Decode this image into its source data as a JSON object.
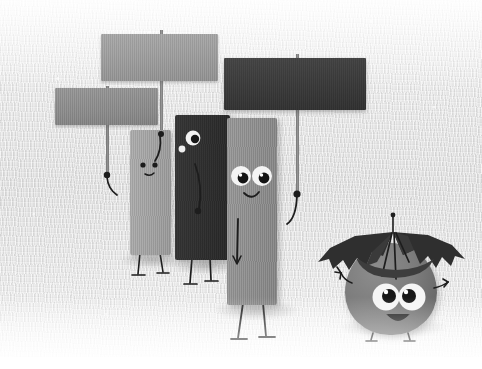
{
  "artwork": {
    "title": "Protesting Rectangles in the Rain",
    "medium": "textured canvas illustration",
    "palette": "grayscale",
    "background_color": "#e8e8e8",
    "canvas_width": 482,
    "canvas_height": 369,
    "illustration_height": 357,
    "bottom_margin_color": "#ffffff"
  },
  "signs": [
    {
      "name": "top-left-protest-sign",
      "label": "",
      "state": "blank",
      "color": "#9c9c9c",
      "x": 101,
      "y": 34,
      "w": 117,
      "h": 47,
      "pole_color": "#8a8a8a"
    },
    {
      "name": "lower-left-protest-sign",
      "label": "",
      "state": "blank",
      "color": "#8a8a8a",
      "x": 55,
      "y": 88,
      "w": 103,
      "h": 37,
      "pole_color": "#7e7e7e"
    },
    {
      "name": "right-protest-sign",
      "label": "",
      "state": "blank",
      "color": "#3a3a3a",
      "x": 224,
      "y": 58,
      "w": 142,
      "h": 52,
      "pole_color": "#6e6e6e"
    }
  ],
  "characters": [
    {
      "name": "light-gray-rectangle-character",
      "expression": "worried",
      "color": "#a3a3a3",
      "eyes": 2,
      "eye_style": "small-dots",
      "mouth": "frown",
      "holds": "lower-left-protest-sign",
      "x": 130,
      "y": 130,
      "w": 41,
      "h": 125
    },
    {
      "name": "dark-rectangle-character",
      "expression": "uneasy",
      "color": "#2f2f2f",
      "eyes": 2,
      "eye_style": "one-large-one-small",
      "mouth": "none",
      "holds": "top-left-protest-sign",
      "x": 175,
      "y": 115,
      "w": 55,
      "h": 145
    },
    {
      "name": "tall-gray-rectangle-character",
      "expression": "smiling",
      "color": "#8d8d8d",
      "eyes": 2,
      "eye_style": "large-round",
      "mouth": "smile",
      "holds": "right-protest-sign",
      "x": 227,
      "y": 118,
      "w": 50,
      "h": 187
    },
    {
      "name": "round-umbrella-character",
      "expression": "happy-open-mouth",
      "color": "#7b7b7b",
      "eyes": 2,
      "eye_style": "large-round",
      "mouth": "open-smile",
      "holds": "broken-umbrella",
      "x": 345,
      "y": 240,
      "w": 95,
      "h": 95
    }
  ],
  "props": [
    {
      "name": "broken-umbrella",
      "state": "torn",
      "color": "#2e2e2e",
      "panels": 4,
      "description": "tattered umbrella with ripped canopy and exposed ribs"
    }
  ],
  "ground": {
    "name": "ground-shadows",
    "count": 4,
    "color": "#6e6e6e"
  }
}
